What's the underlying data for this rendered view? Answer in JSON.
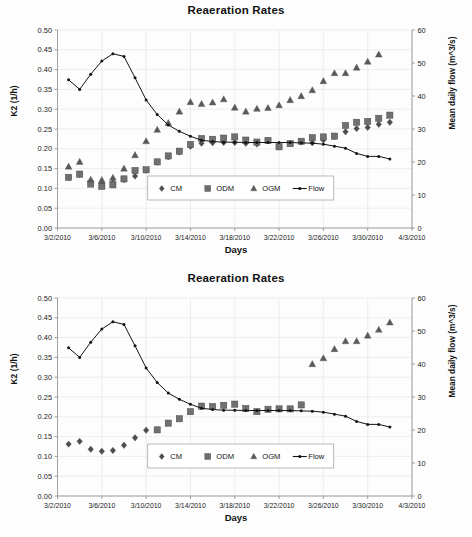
{
  "figure": {
    "background": "#fdfdfd",
    "panels": [
      "top",
      "bottom"
    ]
  },
  "axis_label_left": "K2 (1/h)",
  "axis_label_right": "Mean daily flow (m^3/s)",
  "axis_label_x": "Days",
  "title": "Reaeration Rates",
  "legend": {
    "items": [
      {
        "label": "CM",
        "marker": "diamond",
        "color": "#4d4d4d"
      },
      {
        "label": "ODM",
        "marker": "square",
        "color": "#6e6e6e"
      },
      {
        "label": "OGM",
        "marker": "triangle",
        "color": "#595959"
      },
      {
        "label": "Flow",
        "marker": "line",
        "color": "#141414"
      }
    ]
  },
  "chart_data": [
    {
      "id": "chart-top",
      "type": "scatter",
      "title": "Reaeration Rates",
      "xlabel": "Days",
      "ylabel": "K2 (1/h)",
      "ylabel_secondary": "Mean daily flow (m^3/s)",
      "grid": true,
      "legend_position": "inside-bottom-center",
      "xlim": [
        0,
        32
      ],
      "xticks": [
        0,
        4,
        8,
        12,
        16,
        20,
        24,
        28,
        32
      ],
      "xticklabels": [
        "3/2/2010",
        "3/6/2010",
        "3/10/2010",
        "3/14/2010",
        "3/18/2010",
        "3/22/2010",
        "3/26/2010",
        "3/30/2010",
        "4/3/2010"
      ],
      "ylim": [
        0.0,
        0.5
      ],
      "yticks": [
        0.0,
        0.05,
        0.1,
        0.15,
        0.2,
        0.25,
        0.3,
        0.35,
        0.4,
        0.45,
        0.5
      ],
      "yticklabels": [
        "0.00",
        "0.05",
        "0.10",
        "0.15",
        "0.20",
        "0.25",
        "0.30",
        "0.35",
        "0.40",
        "0.45",
        "0.50"
      ],
      "ylim_secondary": [
        0,
        60
      ],
      "yticks_secondary": [
        0,
        10,
        20,
        30,
        40,
        50,
        60
      ],
      "yticklabels_secondary": [
        "0",
        "10",
        "20",
        "30",
        "40",
        "50",
        "60"
      ],
      "series": [
        {
          "name": "CM",
          "marker": "diamond",
          "axis": "left",
          "x": [
            1,
            2,
            3,
            4,
            5,
            6,
            7,
            8,
            9,
            10,
            11,
            12,
            13,
            14,
            15,
            16,
            17,
            18,
            19,
            20,
            21,
            22,
            23,
            24,
            25,
            26,
            27,
            28,
            29,
            30
          ],
          "values": [
            0.127,
            0.135,
            0.118,
            0.113,
            0.115,
            0.122,
            0.131,
            0.146,
            0.166,
            0.18,
            0.192,
            0.206,
            0.214,
            0.215,
            0.216,
            0.216,
            0.214,
            0.212,
            0.221,
            0.206,
            0.213,
            0.217,
            0.215,
            0.222,
            0.231,
            0.243,
            0.251,
            0.254,
            0.262,
            0.267,
            0.276
          ]
        },
        {
          "name": "ODM",
          "marker": "square",
          "axis": "left",
          "x": [
            1,
            2,
            3,
            4,
            5,
            6,
            7,
            8,
            9,
            10,
            11,
            12,
            13,
            14,
            15,
            16,
            17,
            18,
            19,
            20,
            21,
            22,
            23,
            24,
            25,
            26,
            27,
            28,
            29,
            30
          ],
          "values": [
            0.128,
            0.136,
            0.111,
            0.105,
            0.109,
            0.124,
            0.145,
            0.147,
            0.167,
            0.182,
            0.194,
            0.211,
            0.226,
            0.224,
            0.227,
            0.23,
            0.222,
            0.217,
            0.221,
            0.205,
            0.213,
            0.219,
            0.228,
            0.23,
            0.232,
            0.259,
            0.267,
            0.269,
            0.277,
            0.285,
            0.295
          ]
        },
        {
          "name": "OGM",
          "marker": "triangle",
          "axis": "left",
          "x": [
            1,
            2,
            3,
            4,
            5,
            6,
            7,
            8,
            9,
            10,
            11,
            12,
            13,
            14,
            15,
            16,
            17,
            18,
            19,
            20,
            21,
            22,
            23,
            24,
            25,
            26,
            27,
            28,
            29,
            30
          ],
          "values": [
            0.155,
            0.167,
            0.122,
            0.121,
            0.127,
            0.15,
            0.184,
            0.219,
            0.248,
            0.265,
            0.294,
            0.318,
            0.313,
            0.317,
            0.325,
            0.304,
            0.294,
            0.301,
            0.303,
            0.31,
            0.323,
            0.333,
            0.348,
            0.371,
            0.391,
            0.391,
            0.405,
            0.42,
            0.438
          ]
        },
        {
          "name": "Flow",
          "marker": "line",
          "axis": "right",
          "x": [
            1,
            2,
            3,
            4,
            5,
            6,
            7,
            8,
            9,
            10,
            11,
            12,
            13,
            14,
            15,
            16,
            17,
            18,
            19,
            20,
            21,
            22,
            23,
            24,
            25,
            26,
            27,
            28,
            29,
            30
          ],
          "values": [
            44.9,
            42.0,
            46.6,
            50.6,
            52.8,
            52.0,
            45.5,
            38.8,
            34.4,
            31.2,
            29.3,
            27.8,
            26.6,
            26.2,
            26.0,
            26.0,
            25.9,
            25.9,
            25.9,
            25.9,
            25.9,
            25.8,
            25.7,
            25.4,
            24.8,
            24.2,
            22.6,
            21.7,
            21.7,
            20.9,
            20.4,
            19.8
          ]
        }
      ]
    },
    {
      "id": "chart-bottom",
      "type": "scatter",
      "title": "Reaeration Rates",
      "xlabel": "Days",
      "ylabel": "K2 (1/h)",
      "ylabel_secondary": "Mean daily flow (m^3/s)",
      "grid": true,
      "legend_position": "inside-bottom-center",
      "xlim": [
        0,
        32
      ],
      "xticks": [
        0,
        4,
        8,
        12,
        16,
        20,
        24,
        28,
        32
      ],
      "xticklabels": [
        "3/2/2010",
        "3/6/2010",
        "3/10/2010",
        "3/14/2010",
        "3/18/2010",
        "3/22/2010",
        "3/26/2010",
        "3/30/2010",
        "4/3/2010"
      ],
      "ylim": [
        0.0,
        0.5
      ],
      "yticks": [
        0.0,
        0.05,
        0.1,
        0.15,
        0.2,
        0.25,
        0.3,
        0.35,
        0.4,
        0.45,
        0.5
      ],
      "yticklabels": [
        "0.00",
        "0.05",
        "0.10",
        "0.15",
        "0.20",
        "0.25",
        "0.30",
        "0.35",
        "0.40",
        "0.45",
        "0.50"
      ],
      "ylim_secondary": [
        0,
        60
      ],
      "yticks_secondary": [
        0,
        10,
        20,
        30,
        40,
        50,
        60
      ],
      "yticklabels_secondary": [
        "0",
        "10",
        "20",
        "30",
        "40",
        "50",
        "60"
      ],
      "series": [
        {
          "name": "CM",
          "marker": "diamond",
          "axis": "left",
          "x": [
            1,
            2,
            3,
            4,
            5,
            6,
            7,
            8
          ],
          "values": [
            0.131,
            0.138,
            0.118,
            0.113,
            0.115,
            0.128,
            0.147,
            0.166
          ]
        },
        {
          "name": "ODM",
          "marker": "square",
          "axis": "left",
          "x": [
            9,
            10,
            11,
            12,
            13,
            14,
            15,
            16,
            17,
            18,
            19,
            20,
            21,
            22
          ],
          "values": [
            0.167,
            0.184,
            0.195,
            0.213,
            0.227,
            0.226,
            0.229,
            0.232,
            0.221,
            0.213,
            0.219,
            0.22,
            0.22,
            0.23
          ]
        },
        {
          "name": "OGM",
          "marker": "triangle",
          "axis": "left",
          "x": [
            23,
            24,
            25,
            26,
            27,
            28,
            29,
            30
          ],
          "values": [
            0.333,
            0.348,
            0.371,
            0.391,
            0.391,
            0.405,
            0.42,
            0.438
          ]
        },
        {
          "name": "Flow",
          "marker": "line",
          "axis": "right",
          "x": [
            1,
            2,
            3,
            4,
            5,
            6,
            7,
            8,
            9,
            10,
            11,
            12,
            13,
            14,
            15,
            16,
            17,
            18,
            19,
            20,
            21,
            22,
            23,
            24,
            25,
            26,
            27,
            28,
            29,
            30
          ],
          "values": [
            44.9,
            42.0,
            46.6,
            50.6,
            52.8,
            52.0,
            45.5,
            38.8,
            34.4,
            31.2,
            29.3,
            27.8,
            26.6,
            26.2,
            26.0,
            26.0,
            25.9,
            25.9,
            25.9,
            25.9,
            25.9,
            25.8,
            25.7,
            25.4,
            24.8,
            24.2,
            22.6,
            21.7,
            21.7,
            20.9,
            20.4,
            19.8
          ]
        }
      ]
    }
  ]
}
